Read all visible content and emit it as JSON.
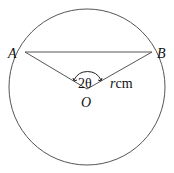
{
  "diagram": {
    "type": "circle-chord-sector",
    "colors": {
      "stroke": "#555555",
      "text": "#111111",
      "background": "#ffffff"
    },
    "circle": {
      "cx": 87,
      "cy": 87,
      "r": 78
    },
    "points": {
      "A": {
        "label": "A",
        "x": 25,
        "y": 52
      },
      "B": {
        "label": "B",
        "x": 152,
        "y": 52
      },
      "O": {
        "label": "O",
        "x": 87,
        "y": 89
      }
    },
    "angle_label": "2θ",
    "radius_label_var": "r",
    "radius_label_unit": "cm"
  }
}
